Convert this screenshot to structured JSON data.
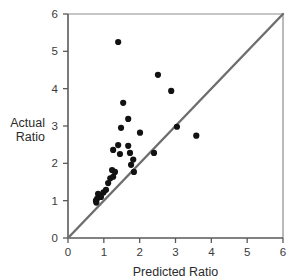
{
  "chart_data": {
    "type": "scatter",
    "title": "",
    "xlabel": "Predicted Ratio",
    "ylabel": "Actual Ratio",
    "ylabel_lines": [
      "Actual",
      "Ratio"
    ],
    "xlim": [
      0,
      6
    ],
    "ylim": [
      0,
      6
    ],
    "xticks": [
      0,
      1,
      2,
      3,
      4,
      5,
      6
    ],
    "yticks": [
      0,
      1,
      2,
      3,
      4,
      5,
      6
    ],
    "xticklabels": [
      "0",
      "1",
      "2",
      "3",
      "4",
      "5",
      "6"
    ],
    "yticklabels": [
      "0",
      "1",
      "2",
      "3",
      "4",
      "5",
      "6"
    ],
    "grid": false,
    "legend": null,
    "reference_line": {
      "name": "identity-line",
      "description": "y = x diagonal",
      "from": [
        0,
        0
      ],
      "to": [
        6,
        6
      ],
      "color": "#6e6e6e"
    },
    "marker": {
      "shape": "circle",
      "color": "#121212",
      "size": 3.1
    },
    "points": [
      [
        1.4,
        5.25
      ],
      [
        2.51,
        4.37
      ],
      [
        2.88,
        3.94
      ],
      [
        1.54,
        3.62
      ],
      [
        1.68,
        3.19
      ],
      [
        3.04,
        2.98
      ],
      [
        1.48,
        2.95
      ],
      [
        2.01,
        2.82
      ],
      [
        3.58,
        2.74
      ],
      [
        1.4,
        2.49
      ],
      [
        1.68,
        2.47
      ],
      [
        1.26,
        2.36
      ],
      [
        1.73,
        2.28
      ],
      [
        2.4,
        2.28
      ],
      [
        1.45,
        2.25
      ],
      [
        1.82,
        2.1
      ],
      [
        1.76,
        1.96
      ],
      [
        1.23,
        1.82
      ],
      [
        1.84,
        1.77
      ],
      [
        1.31,
        1.77
      ],
      [
        1.26,
        1.64
      ],
      [
        1.18,
        1.6
      ],
      [
        1.12,
        1.47
      ],
      [
        1.06,
        1.29
      ],
      [
        0.99,
        1.22
      ],
      [
        0.92,
        1.1
      ],
      [
        0.84,
        1.18
      ],
      [
        0.81,
        1.05
      ],
      [
        0.78,
        1.0
      ],
      [
        0.79,
        0.95
      ]
    ],
    "colors": {
      "point": "#121212",
      "line": "#6e6e6e",
      "axis": "#5a5a5a",
      "frame": "#8d8d8d",
      "text": "#2b2b2b",
      "background": "#ffffff"
    }
  }
}
